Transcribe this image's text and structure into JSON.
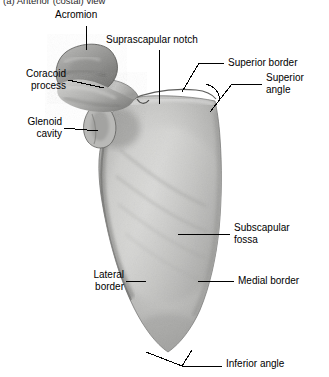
{
  "figure": {
    "caption_clipped": "(a) Anterior (costal) view",
    "background_color": "#ffffff",
    "ink_color": "#000000",
    "bone_tone_light": "#d8d8d6",
    "bone_tone_mid": "#b4b4b2",
    "bone_tone_dark": "#8a8a88",
    "bone_tone_shadow": "#5f5f5e"
  },
  "labels": [
    {
      "id": "acromion",
      "text": "Acromion"
    },
    {
      "id": "suprascapular-notch",
      "text": "Suprascapular notch"
    },
    {
      "id": "superior-border",
      "text": "Superior border"
    },
    {
      "id": "superior-angle",
      "text": "Superior\nangle"
    },
    {
      "id": "coracoid-process",
      "text": "Coracoid\nprocess"
    },
    {
      "id": "glenoid-cavity",
      "text": "Glenoid\ncavity"
    },
    {
      "id": "subscapular-fossa",
      "text": "Subscapular\nfossa"
    },
    {
      "id": "lateral-border",
      "text": "Lateral\nborder"
    },
    {
      "id": "medial-border",
      "text": "Medial border"
    },
    {
      "id": "inferior-angle",
      "text": "Inferior angle"
    }
  ]
}
